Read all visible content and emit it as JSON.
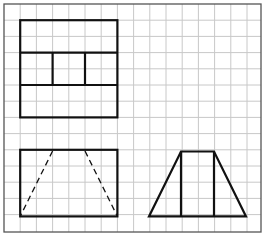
{
  "diagram": {
    "grid": {
      "columns": 16,
      "rows": 14,
      "line_color": "#c8c8c8",
      "border_color": "#555555"
    },
    "stroke_color": "#111111",
    "views": [
      {
        "name": "top-view",
        "shape": "rectangle divided into three horizontal bands; middle band split into three cells",
        "cells": {
          "col_from": 1,
          "col_to": 7,
          "row_from": 1,
          "row_to": 7
        }
      },
      {
        "name": "front-view",
        "shape": "rectangle with two dashed hidden edges forming a trapezoid",
        "cells": {
          "col_from": 1,
          "col_to": 7,
          "row_from": 9,
          "row_to": 13
        }
      },
      {
        "name": "side-view",
        "shape": "isosceles trapezoid with two vertical interior lines",
        "cells": {
          "col_from": 9,
          "col_to": 15,
          "row_from": 9,
          "row_to": 13
        }
      }
    ]
  }
}
